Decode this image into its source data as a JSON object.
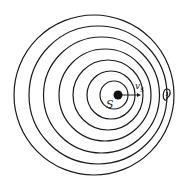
{
  "diagram": {
    "background": "#ffffff",
    "stroke_color": "#1a1a1a",
    "source": {
      "label": "S",
      "cx": 118,
      "cy": 95,
      "r": 4.5
    },
    "velocity": {
      "label": "v",
      "subscript": "S",
      "x1": 122,
      "y1": 95,
      "x2": 141,
      "y2": 95
    },
    "observer": {
      "icon": "ear-icon",
      "x": 166,
      "y": 95
    },
    "wavefronts": [
      {
        "cx": 114,
        "cy": 95,
        "r": 14
      },
      {
        "cx": 111,
        "cy": 95,
        "r": 24
      },
      {
        "cx": 108,
        "cy": 95,
        "r": 35
      },
      {
        "cx": 105,
        "cy": 95,
        "r": 46
      },
      {
        "cx": 101.5,
        "cy": 95,
        "r": 58
      },
      {
        "cx": 98,
        "cy": 95,
        "r": 69
      },
      {
        "cx": 94,
        "cy": 95,
        "r": 80
      }
    ]
  }
}
